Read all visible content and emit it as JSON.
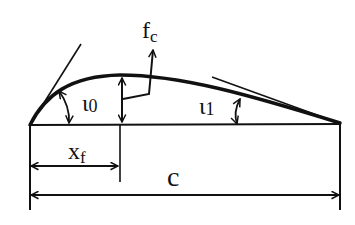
{
  "diagram": {
    "labels": {
      "max_camber": "f",
      "max_camber_sub": "c",
      "leading_edge_angle": "ι",
      "leading_edge_angle_sub": "0",
      "trailing_edge_angle": "ι",
      "trailing_edge_angle_sub": "1",
      "max_camber_position": "x",
      "max_camber_position_sub": "f",
      "chord": "c"
    },
    "colors": {
      "stroke": "#111111",
      "background": "#ffffff"
    }
  }
}
